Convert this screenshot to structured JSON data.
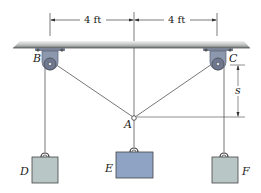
{
  "diagram": {
    "type": "pulley-system",
    "dimensions": {
      "left_span": "4 ft",
      "right_span": "4 ft",
      "vertical_offset": "s"
    },
    "points": {
      "A": "A",
      "B": "B",
      "C": "C",
      "D": "D",
      "E": "E",
      "F": "F"
    },
    "colors": {
      "ceiling": "#8a8f8c",
      "pulley": "#8d97ad",
      "block_side": "#b8c7c5",
      "block_center": "#8fa3c4",
      "cable": "#6b6b6b"
    }
  }
}
